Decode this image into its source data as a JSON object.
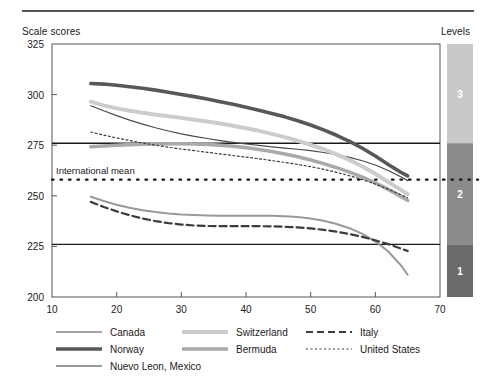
{
  "header": {
    "y_axis_title": "Scale scores",
    "levels_title": "Levels"
  },
  "chart_data": {
    "type": "line",
    "title": "",
    "xlabel": "",
    "ylabel": "Scale scores",
    "xlim": [
      10,
      70
    ],
    "ylim": [
      200,
      325
    ],
    "xticks": [
      10,
      20,
      30,
      40,
      50,
      60,
      70
    ],
    "yticks": [
      200,
      225,
      250,
      275,
      300,
      325
    ],
    "grid": false,
    "legend_position": "bottom",
    "annotations": [
      {
        "label": "International mean",
        "type": "hline",
        "value": 258,
        "style": "dotted"
      },
      {
        "label": "",
        "type": "hline",
        "value": 276,
        "style": "solid"
      },
      {
        "label": "",
        "type": "hline",
        "value": 226,
        "style": "solid"
      }
    ],
    "levels": [
      {
        "label": "3",
        "ymin": 276,
        "ymax": 325,
        "color": "#c9c9c9"
      },
      {
        "label": "2",
        "ymin": 226,
        "ymax": 276,
        "color": "#8b8b8b"
      },
      {
        "label": "1",
        "ymin": 200,
        "ymax": 226,
        "color": "#6b6b6b"
      }
    ],
    "x": [
      16,
      18,
      20,
      22,
      24,
      26,
      28,
      30,
      32,
      34,
      36,
      38,
      40,
      42,
      44,
      46,
      48,
      50,
      52,
      54,
      56,
      58,
      60,
      62,
      64,
      65
    ],
    "series": [
      {
        "name": "Canada",
        "color": "#4a4a4a",
        "width": 1.2,
        "dash": "none",
        "values": [
          294.5,
          292.0,
          289.6,
          287.4,
          285.4,
          283.6,
          282.0,
          280.6,
          279.4,
          278.3,
          277.3,
          276.4,
          275.6,
          274.9,
          274.2,
          273.6,
          273.0,
          272.3,
          271.4,
          270.3,
          269.0,
          267.3,
          265.2,
          262.5,
          259.3,
          257.5
        ]
      },
      {
        "name": "Norway",
        "color": "#585858",
        "width": 3.6,
        "dash": "none",
        "values": [
          305.5,
          305.2,
          304.6,
          303.9,
          303.1,
          302.2,
          301.2,
          300.1,
          299.0,
          297.8,
          296.5,
          295.2,
          293.8,
          292.3,
          290.7,
          289.0,
          287.1,
          285.0,
          282.6,
          279.9,
          276.9,
          273.5,
          269.7,
          265.5,
          261.5,
          259.8
        ]
      },
      {
        "name": "Nuevo Leon, Mexico",
        "color": "#999999",
        "width": 2.0,
        "dash": "none",
        "values": [
          249.5,
          247.4,
          245.6,
          244.1,
          242.9,
          242.0,
          241.3,
          240.8,
          240.5,
          240.3,
          240.2,
          240.2,
          240.2,
          240.2,
          240.1,
          239.9,
          239.5,
          238.8,
          237.7,
          236.1,
          234.0,
          231.2,
          227.5,
          222.5,
          215.5,
          211.0
        ]
      },
      {
        "name": "Switzerland",
        "color": "#cccccc",
        "width": 4.0,
        "dash": "none",
        "values": [
          296.5,
          294.7,
          293.2,
          292.0,
          291.0,
          290.1,
          289.3,
          288.5,
          287.6,
          286.7,
          285.7,
          284.6,
          283.4,
          282.1,
          280.6,
          279.0,
          277.2,
          275.2,
          273.0,
          270.5,
          267.7,
          264.5,
          260.9,
          256.8,
          252.8,
          250.8
        ]
      },
      {
        "name": "Bermuda",
        "color": "#a9a9a9",
        "width": 3.6,
        "dash": "none",
        "values": [
          274.2,
          274.6,
          275.0,
          275.3,
          275.5,
          275.6,
          275.7,
          275.7,
          275.6,
          275.4,
          275.0,
          274.5,
          273.8,
          272.9,
          271.9,
          270.7,
          269.3,
          267.7,
          265.9,
          263.9,
          261.7,
          259.2,
          256.4,
          253.2,
          249.6,
          247.7
        ]
      },
      {
        "name": "Italy",
        "color": "#3c3c3c",
        "width": 2.2,
        "dash": "7,4",
        "values": [
          247.0,
          244.5,
          242.3,
          240.4,
          238.8,
          237.5,
          236.5,
          235.8,
          235.3,
          235.1,
          235.0,
          235.0,
          235.0,
          235.0,
          234.9,
          234.7,
          234.4,
          233.9,
          233.2,
          232.3,
          231.1,
          229.7,
          228.0,
          226.1,
          223.9,
          222.7
        ]
      },
      {
        "name": "United States",
        "color": "#3c3c3c",
        "width": 1.2,
        "dash": "2,2.5",
        "values": [
          281.5,
          280.0,
          278.6,
          277.3,
          276.1,
          275.0,
          274.0,
          273.1,
          272.3,
          271.5,
          270.7,
          269.9,
          269.1,
          268.3,
          267.4,
          266.5,
          265.5,
          264.4,
          263.1,
          261.6,
          259.9,
          258.0,
          255.8,
          253.3,
          250.5,
          249.0
        ]
      }
    ]
  },
  "legend": {
    "columns": [
      [
        {
          "name": "Canada",
          "color": "#4a4a4a",
          "width": 1.2,
          "dash": "none"
        },
        {
          "name": "Norway",
          "color": "#585858",
          "width": 3.6,
          "dash": "none"
        },
        {
          "name": "Nuevo Leon, Mexico",
          "color": "#999999",
          "width": 2.0,
          "dash": "none"
        }
      ],
      [
        {
          "name": "Switzerland",
          "color": "#cccccc",
          "width": 4.0,
          "dash": "none"
        },
        {
          "name": "Bermuda",
          "color": "#a9a9a9",
          "width": 3.6,
          "dash": "none"
        }
      ],
      [
        {
          "name": "Italy",
          "color": "#3c3c3c",
          "width": 2.2,
          "dash": "7,4"
        },
        {
          "name": "United States",
          "color": "#3c3c3c",
          "width": 1.2,
          "dash": "2,2.5"
        }
      ]
    ]
  }
}
